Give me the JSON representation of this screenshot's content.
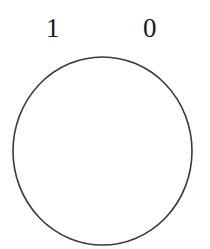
{
  "diagram": {
    "labels": {
      "left": "1",
      "right": "0"
    },
    "circle": {
      "stroke_color": "#3a3a3a",
      "fill_color": "#ffffff"
    }
  }
}
